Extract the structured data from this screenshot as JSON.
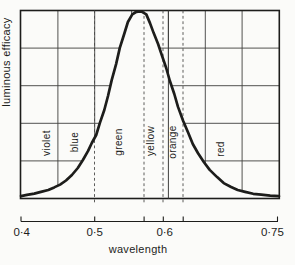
{
  "figure": {
    "background": "#fbfbf9",
    "ink": "#1d1d1b",
    "grid_color": "#3f3f3d",
    "dash_color": "#4a4a48",
    "y_axis_label": "luminous efficacy",
    "x_axis_label": "wavelength",
    "x_tick_labels": [
      {
        "text": "0·4",
        "um": 0.401
      },
      {
        "text": "0·5",
        "um": 0.5
      },
      {
        "text": "0·6",
        "um": 0.595
      },
      {
        "text": "0·75",
        "um": 0.741
      }
    ],
    "ruler_ticks_um": [
      0.4,
      0.5,
      0.567,
      0.593,
      0.62,
      0.748
    ],
    "grid_x_um": [
      0.45,
      0.5,
      0.55,
      0.6,
      0.65,
      0.7
    ],
    "grid_y_fractions": [
      0.2,
      0.4,
      0.6,
      0.8
    ],
    "solid_full_height_um": 0.6,
    "dashed_boundaries_um": [
      0.4997,
      0.5669,
      0.5926,
      0.6198
    ],
    "color_bands": [
      {
        "label": "violet",
        "from_um": 0.4,
        "to_um": 0.45,
        "label_um": 0.434,
        "label_y": 143
      },
      {
        "label": "blue",
        "from_um": 0.45,
        "to_um": 0.5,
        "label_um": 0.472,
        "label_y": 142
      },
      {
        "label": "green",
        "from_um": 0.5,
        "to_um": 0.57,
        "label_um": 0.532,
        "label_y": 142
      },
      {
        "label": "yellow",
        "from_um": 0.57,
        "to_um": 0.59,
        "label_um": 0.576,
        "label_y": 141
      },
      {
        "label": "orange",
        "from_um": 0.59,
        "to_um": 0.62,
        "label_um": 0.605,
        "label_y": 142
      },
      {
        "label": "red",
        "from_um": 0.62,
        "to_um": 0.75,
        "label_um": 0.67,
        "label_y": 149
      }
    ]
  },
  "chart_data": {
    "type": "line",
    "title": "",
    "xlabel": "wavelength",
    "ylabel": "luminous efficacy",
    "x_unit": "micrometre",
    "xlim": [
      0.4,
      0.75
    ],
    "ylim": [
      0,
      1
    ],
    "grid": true,
    "legend": "none",
    "series": [
      {
        "name": "relative luminous efficacy",
        "points": [
          [
            0.4,
            0.013
          ],
          [
            0.408,
            0.019
          ],
          [
            0.418,
            0.026
          ],
          [
            0.427,
            0.035
          ],
          [
            0.437,
            0.045
          ],
          [
            0.445,
            0.059
          ],
          [
            0.453,
            0.074
          ],
          [
            0.461,
            0.096
          ],
          [
            0.469,
            0.125
          ],
          [
            0.477,
            0.162
          ],
          [
            0.484,
            0.205
          ],
          [
            0.491,
            0.253
          ],
          [
            0.496,
            0.295
          ],
          [
            0.502,
            0.338
          ],
          [
            0.507,
            0.402
          ],
          [
            0.513,
            0.471
          ],
          [
            0.518,
            0.545
          ],
          [
            0.523,
            0.63
          ],
          [
            0.529,
            0.715
          ],
          [
            0.534,
            0.801
          ],
          [
            0.54,
            0.875
          ],
          [
            0.545,
            0.939
          ],
          [
            0.551,
            0.979
          ],
          [
            0.556,
            0.992
          ],
          [
            0.563,
            0.995
          ],
          [
            0.57,
            0.979
          ],
          [
            0.575,
            0.933
          ],
          [
            0.58,
            0.88
          ],
          [
            0.586,
            0.822
          ],
          [
            0.591,
            0.763
          ],
          [
            0.597,
            0.694
          ],
          [
            0.602,
            0.625
          ],
          [
            0.608,
            0.556
          ],
          [
            0.613,
            0.487
          ],
          [
            0.62,
            0.412
          ],
          [
            0.627,
            0.348
          ],
          [
            0.633,
            0.29
          ],
          [
            0.64,
            0.242
          ],
          [
            0.648,
            0.194
          ],
          [
            0.656,
            0.152
          ],
          [
            0.666,
            0.114
          ],
          [
            0.675,
            0.082
          ],
          [
            0.685,
            0.061
          ],
          [
            0.694,
            0.045
          ],
          [
            0.704,
            0.035
          ],
          [
            0.715,
            0.025
          ],
          [
            0.726,
            0.02
          ],
          [
            0.738,
            0.015
          ],
          [
            0.75,
            0.012
          ]
        ]
      }
    ]
  }
}
